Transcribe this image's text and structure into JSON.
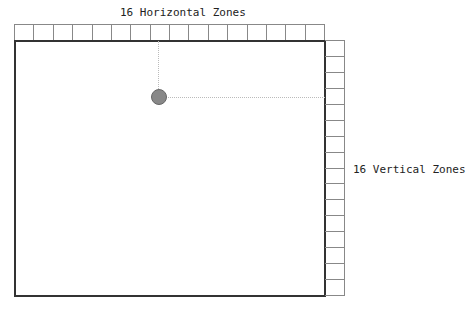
{
  "diagram": {
    "top_label": "16 Horizontal Zones",
    "right_label": "16 Vertical Zones",
    "horizontal_zone_count": 16,
    "vertical_zone_count": 16,
    "colors": {
      "screen_border": "#333333",
      "zone_border": "#888888",
      "dot_fill": "#888888",
      "guide_line": "#bbbbbb"
    },
    "pointer": {
      "zone_x": 8,
      "zone_y": 4
    }
  }
}
